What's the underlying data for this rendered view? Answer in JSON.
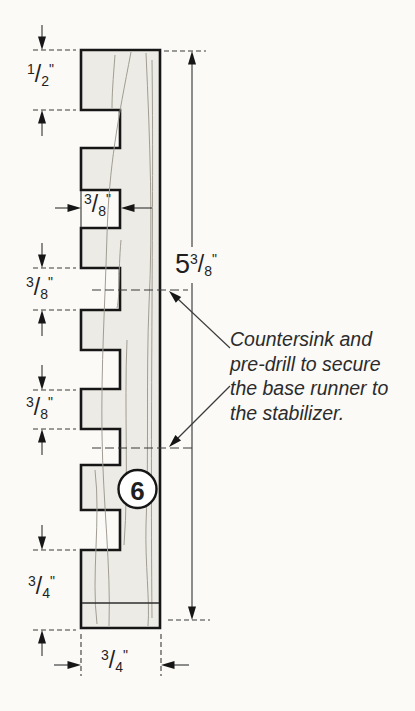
{
  "figure": {
    "part_number": "6",
    "note_lines": [
      "Countersink and",
      "pre-drill to secure",
      "the base runner to",
      "the stabilizer."
    ],
    "glyphs": {
      "slash": "/",
      "inch": "\""
    },
    "dimensions": {
      "top_tooth_height": {
        "num": "1",
        "den": "2"
      },
      "tooth_width": {
        "num": "3",
        "den": "8"
      },
      "notch_height": {
        "num": "3",
        "den": "8"
      },
      "tooth_height": {
        "num": "3",
        "den": "8"
      },
      "bottom_section_height": {
        "num": "3",
        "den": "4"
      },
      "part_thickness": {
        "num": "3",
        "den": "4"
      },
      "overall_height": {
        "whole": "5",
        "num": "3",
        "den": "8"
      }
    },
    "colors": {
      "paper": "#fbfaf7",
      "outline": "#161616",
      "wood": "#ecebe5",
      "line": "#3b3b3b",
      "grain": "#a19d93",
      "ink": "#1f1f1f"
    }
  }
}
